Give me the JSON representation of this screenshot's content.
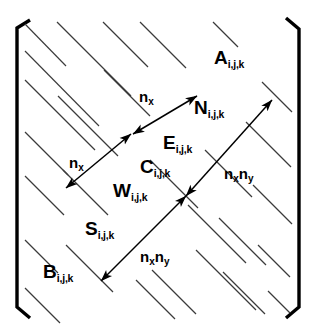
{
  "figure": {
    "colors": {
      "bracket": "#000000",
      "band_line": "#3b3b3b",
      "arrow": "#000000",
      "text": "#000000",
      "background": "#ffffff"
    },
    "brackets": {
      "left_name": "left-matrix-bracket",
      "right_name": "right-matrix-bracket"
    }
  },
  "stencil_labels": [
    {
      "id": "A",
      "base": "A",
      "subscript": "i,j,k",
      "x": 268,
      "y": 57,
      "anchor": "end"
    },
    {
      "id": "N",
      "base": "N",
      "subscript": "i,j,k",
      "x": 198,
      "y": 107,
      "anchor": "start"
    },
    {
      "id": "E",
      "base": "E",
      "subscript": "i,j,k",
      "x": 166,
      "y": 142,
      "anchor": "start"
    },
    {
      "id": "C",
      "base": "C",
      "subscript": "i,j,k",
      "x": 143,
      "y": 166,
      "anchor": "start"
    },
    {
      "id": "W",
      "base": "W",
      "subscript": "i,j,k",
      "x": 117,
      "y": 190,
      "anchor": "start"
    },
    {
      "id": "S",
      "base": "S",
      "subscript": "i,j,k",
      "x": 88,
      "y": 228,
      "anchor": "start"
    },
    {
      "id": "B",
      "base": "B",
      "subscript": "i,j,k",
      "x": 46,
      "y": 271,
      "anchor": "start"
    }
  ],
  "distance_labels": [
    {
      "id": "nx-top",
      "text": "n",
      "subscript": "x",
      "second": "",
      "second_sub": "",
      "x": 162,
      "y": 98,
      "anchor": "end"
    },
    {
      "id": "nx-left",
      "text": "n",
      "subscript": "x",
      "second": "",
      "second_sub": "",
      "x": 91,
      "y": 164,
      "anchor": "end"
    },
    {
      "id": "nxny-right",
      "text": "n",
      "subscript": "x",
      "second": "n",
      "second_sub": "y",
      "x": 225,
      "y": 175,
      "anchor": "start"
    },
    {
      "id": "nxny-bottom",
      "text": "n",
      "subscript": "x",
      "second": "n",
      "second_sub": "y",
      "x": 141,
      "y": 258,
      "anchor": "start"
    }
  ],
  "arrows": [
    {
      "id": "nx-top-arrow",
      "x1": 133,
      "y1": 134,
      "x2": 197,
      "y2": 96,
      "double": true
    },
    {
      "id": "nx-left-arrow",
      "x1": 66,
      "y1": 188,
      "x2": 131,
      "y2": 134,
      "double": true
    },
    {
      "id": "nxny-right-arrow",
      "x1": 186,
      "y1": 196,
      "x2": 272,
      "y2": 100,
      "double": true
    },
    {
      "id": "nxny-bottom-arrow",
      "x1": 101,
      "y1": 281,
      "x2": 186,
      "y2": 196,
      "double": true
    }
  ],
  "band_diagonals": {
    "description": "Parallel thin diagonals representing nonzero bands of the sparse matrix",
    "count_upper_left": 7,
    "count_lower_right": 7,
    "count_main": 3,
    "angle_deg": 45
  }
}
